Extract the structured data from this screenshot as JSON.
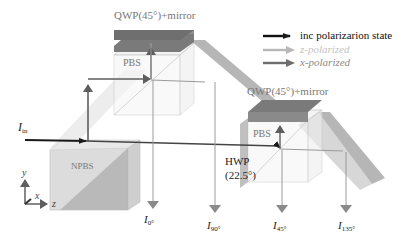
{
  "diagram": {
    "labels": {
      "qwp_top": "QWP(45°)+mirror",
      "qwp_right": "QWP(45°)+mirror",
      "pbs_top": "PBS",
      "pbs_right": "PBS",
      "npbs": "NPBS",
      "hwp_line1": "HWP",
      "hwp_line2": "(22.5°)",
      "input": {
        "main": "I",
        "sub": "in"
      },
      "outputs": [
        {
          "main": "I",
          "sub": "0°"
        },
        {
          "main": "I",
          "sub": "90°"
        },
        {
          "main": "I",
          "sub": "45°"
        },
        {
          "main": "I",
          "sub": "135°"
        }
      ],
      "axes": {
        "y": "y",
        "x": "x",
        "z": "z"
      }
    },
    "legend": [
      {
        "label": "inc polarizarion state",
        "color": "#111111"
      },
      {
        "label": "z-polarized",
        "color": "#b8b8b8"
      },
      {
        "label": "x-polarized",
        "color": "#6e6e6e"
      }
    ],
    "colors": {
      "incident": "#1a1a1a",
      "z_polarized": "#b8b8b8",
      "x_polarized": "#6e6e6e",
      "mirror_top": "#6f6f6f",
      "beam_band": "#a9a9a9",
      "cube_fill": "#e6e6e6"
    }
  }
}
